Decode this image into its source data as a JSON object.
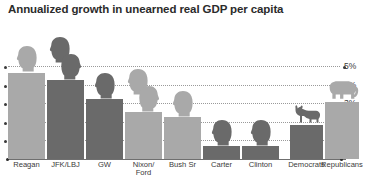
{
  "chart_data": {
    "type": "bar",
    "title": "Annualized growth in unearned real GDP per capita",
    "xlabel": "",
    "ylabel": "",
    "ylim": [
      0,
      5.4
    ],
    "grid": true,
    "legend": false,
    "ytick_labels": [
      "1%",
      "2%",
      "3%",
      "4%",
      "5%"
    ],
    "ytick_values": [
      1,
      2,
      3,
      4,
      5
    ],
    "categories": [
      "Reagan",
      "JFK/LBJ",
      "GW",
      "Nixon/\nFord",
      "Bush Sr",
      "Carter",
      "Clinton",
      "Democrats",
      "Republicans"
    ],
    "values": [
      4.65,
      4.25,
      3.2,
      2.55,
      2.25,
      0.7,
      0.7,
      1.85,
      3.05
    ],
    "party": [
      "republican",
      "democrat",
      "democrat",
      "republican",
      "republican",
      "democrat",
      "democrat",
      "democrat",
      "republican"
    ],
    "annotations": {
      "democrat_symbol": "donkey",
      "republican_symbol": "elephant",
      "president_heads": [
        1,
        2,
        1,
        2,
        1,
        1,
        1
      ]
    }
  },
  "colors": {
    "bar_light": "#a9a9a9",
    "bar_dark": "#6a6a6a",
    "text": "#3a3a3a",
    "title": "#2b2b2b",
    "gridline": "#9a9a9a",
    "background": "#ffffff"
  }
}
